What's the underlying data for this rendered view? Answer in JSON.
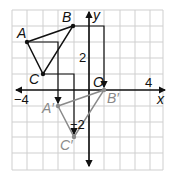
{
  "graph": {
    "axes": {
      "x_label": "x",
      "y_label": "y",
      "origin_label": "O"
    },
    "ticks": {
      "x_neg": "−4",
      "x_pos": "4",
      "y_pos": "2",
      "y_neg": "−2"
    },
    "original": {
      "A": "A",
      "B": "B",
      "C": "C"
    },
    "image": {
      "A": "A′",
      "B": "B′",
      "C": "C′"
    },
    "colors": {
      "original": "#111111",
      "image": "#8a8a8a",
      "grid": "#cfcfcf"
    }
  }
}
